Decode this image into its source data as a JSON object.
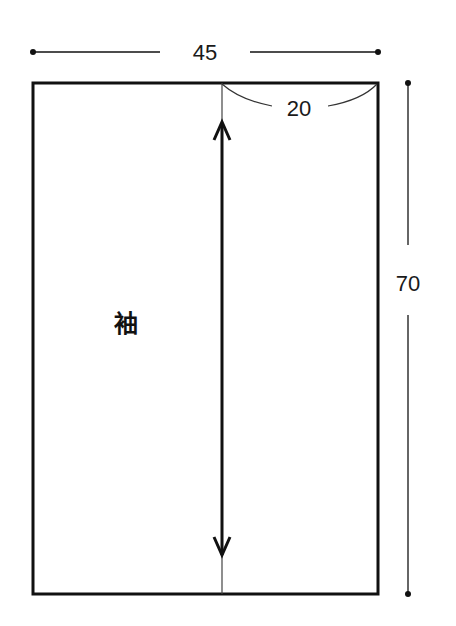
{
  "diagram": {
    "type": "sewing-pattern-piece",
    "piece_label": "袖",
    "dimensions": {
      "width": "45",
      "height": "70",
      "top_segment": "20"
    },
    "grainline": "double-headed-arrow-vertical",
    "colors": {
      "line": "#111111",
      "background": "#ffffff"
    }
  }
}
